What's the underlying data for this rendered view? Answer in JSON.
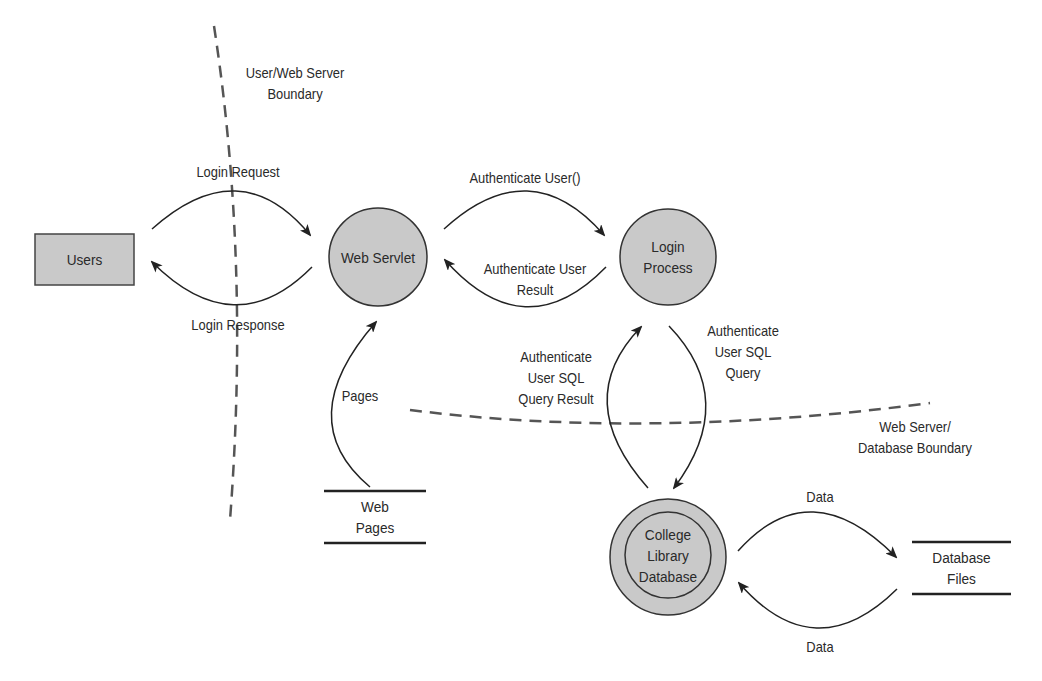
{
  "diagram": {
    "type": "data-flow-diagram",
    "colors": {
      "process_fill": "#c9c9c9",
      "stroke": "#333333",
      "boundary": "#555555",
      "background": "#ffffff"
    },
    "entities": [
      {
        "id": "users",
        "label": "Users",
        "shape": "rectangle"
      }
    ],
    "processes": [
      {
        "id": "web_servlet",
        "label": "Web Servlet",
        "shape": "circle"
      },
      {
        "id": "login_process",
        "label": "Login\nProcess",
        "shape": "circle"
      },
      {
        "id": "college_library_db",
        "label": "College\nLibrary\nDatabase",
        "shape": "double-circle"
      }
    ],
    "stores": [
      {
        "id": "web_pages",
        "label": "Web\nPages"
      },
      {
        "id": "database_files",
        "label": "Database\nFiles"
      }
    ],
    "flows": [
      {
        "label": "Login Request",
        "from": "Users",
        "to": "Web Servlet"
      },
      {
        "label": "Login Response",
        "from": "Web Servlet",
        "to": "Users"
      },
      {
        "label": "Authenticate User()",
        "from": "Web Servlet",
        "to": "Login Process"
      },
      {
        "label": "Authenticate User\nResult",
        "from": "Login Process",
        "to": "Web Servlet"
      },
      {
        "label": "Pages",
        "from": "Web Pages",
        "to": "Web Servlet"
      },
      {
        "label": "Authenticate\nUser SQL\nQuery",
        "from": "Login Process",
        "to": "College Library Database"
      },
      {
        "label": "Authenticate\nUser SQL\nQuery Result",
        "from": "College Library Database",
        "to": "Login Process"
      },
      {
        "label": "Data",
        "from": "College Library Database",
        "to": "Database Files"
      },
      {
        "label": "Data",
        "from": "Database Files",
        "to": "College Library Database"
      }
    ],
    "boundaries": [
      {
        "label": "User/Web Server\nBoundary"
      },
      {
        "label": "Web Server/\nDatabase Boundary"
      }
    ]
  }
}
